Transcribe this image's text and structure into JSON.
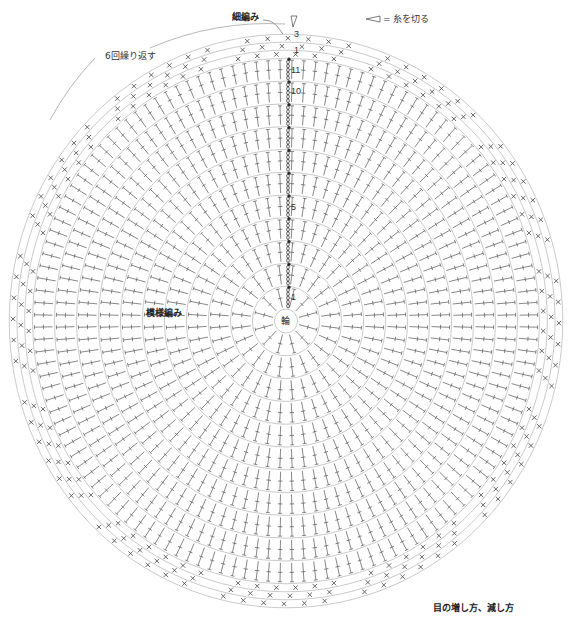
{
  "title_labels": {
    "single_crochet": "細編み",
    "cut_yarn_legend": "◁ = 糸を切る",
    "repeat_note": "6回繰り返す",
    "pattern_stitch": "模様編み",
    "center_ring": "輪",
    "increase_decrease": "目の増し方、減し方"
  },
  "round_labels": {
    "sc_rounds": [
      "1",
      "2",
      "3"
    ],
    "pattern_rounds_labeled": [
      "1",
      "5",
      "10",
      "11"
    ]
  },
  "chart_info": {
    "pattern_rounds": 11,
    "single_crochet_rounds": 3,
    "repeats": 6,
    "center": "magic ring"
  },
  "colors": {
    "ring_lines": "#b8b8b8",
    "stitch_lines": "#555555",
    "text": "#222222",
    "background": "#ffffff"
  }
}
